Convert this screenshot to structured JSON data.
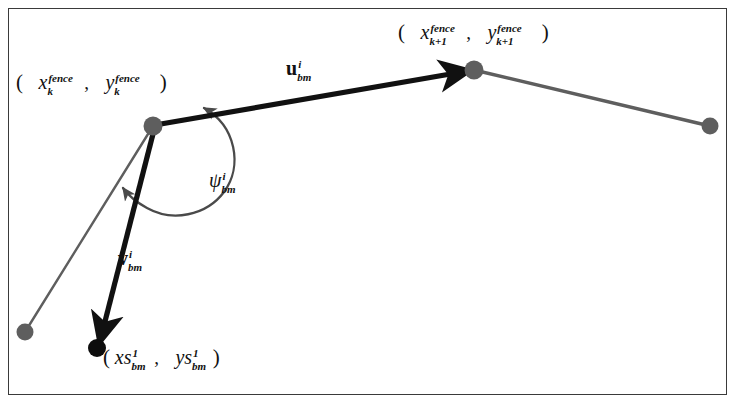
{
  "figure": {
    "type": "vector-geometry-diagram",
    "caption": "",
    "background_color": "#ffffff",
    "border_color": "#3a3a3a",
    "colors": {
      "node_gray": "#5e5e5e",
      "node_black": "#0d0d0d",
      "thin_path": "#5e5e5e",
      "bold_vector": "#111111",
      "angle_arc": "#4a4a4a"
    }
  },
  "labels": {
    "waypoint_k": {
      "name": "waypoint-k-coordinate-label",
      "open_paren": "(",
      "x_base": "x",
      "x_sup": "fence",
      "x_sub": "k",
      "comma": ",",
      "y_base": "y",
      "y_sup": "fence",
      "y_sub": "k",
      "close_paren": ")",
      "plain_text": "( x_k^fence , y_k^fence )"
    },
    "waypoint_k_plus_1": {
      "name": "waypoint-k-plus-1-coordinate-label",
      "open_paren": "(",
      "x_base": "x",
      "x_sup": "fence",
      "x_sub": "k+1",
      "comma": ",",
      "y_base": "y",
      "y_sup": "fence",
      "y_sub": "k+1",
      "close_paren": ")",
      "plain_text": "( x_{k+1}^fence , y_{k+1}^fence )"
    },
    "vector_u": {
      "name": "vector-u-label",
      "base": "u",
      "sup": "i",
      "sub": "bm",
      "plain_text": "u_bm^i"
    },
    "vector_v": {
      "name": "vector-v-label",
      "base": "v",
      "sup": "i",
      "sub": "bm",
      "plain_text": "v_bm^i"
    },
    "angle_psi": {
      "name": "angle-psi-label",
      "base": "ψ",
      "sup": "i",
      "sub": "bm",
      "plain_text": "psi_bm^i"
    },
    "sensor_point": {
      "name": "sensor-point-coordinate-label",
      "open_paren": "(",
      "x_base": "xs",
      "x_sup": "1",
      "x_sub": "bm",
      "comma": ",",
      "y_base": "ys",
      "y_sup": "1",
      "y_sub": "bm",
      "close_paren": ")",
      "plain_text": "( xs_bm^1 , ys_bm^1 )"
    }
  },
  "geometry": {
    "nodes": [
      {
        "id": "node-k",
        "x": 153,
        "y": 126,
        "r": 9.5,
        "fill": "#5e5e5e",
        "label": "waypoint_k"
      },
      {
        "id": "node-k-plus-1",
        "x": 474,
        "y": 70,
        "r": 9.5,
        "fill": "#5e5e5e",
        "label": "waypoint_k_plus_1"
      },
      {
        "id": "node-k-plus-2",
        "x": 710,
        "y": 126,
        "r": 8.5,
        "fill": "#5e5e5e",
        "label": ""
      },
      {
        "id": "node-prev-fence",
        "x": 25,
        "y": 332,
        "r": 8.5,
        "fill": "#5e5e5e",
        "label": ""
      },
      {
        "id": "node-sensor",
        "x": 97,
        "y": 348,
        "r": 9.0,
        "fill": "#0d0d0d",
        "label": "sensor_point"
      }
    ],
    "thin_segments": [
      {
        "id": "segment-k1-to-k2",
        "from": "node-k-plus-1",
        "to": "node-k-plus-2"
      },
      {
        "id": "segment-k-to-prev",
        "from": "node-k",
        "to": "node-prev-fence"
      }
    ],
    "bold_vectors": [
      {
        "id": "vector-u",
        "from": "node-k",
        "to": "node-k-plus-1",
        "label": "vector_u"
      },
      {
        "id": "vector-v",
        "from": "node-k",
        "to": "node-sensor",
        "label": "vector_v"
      }
    ],
    "angle_arc": {
      "id": "angle-arc-psi",
      "center": "node-k",
      "radius": 58,
      "from_vector": "vector-u",
      "to_vector": "vector-v",
      "double_headed": true,
      "label": "angle_psi"
    }
  }
}
